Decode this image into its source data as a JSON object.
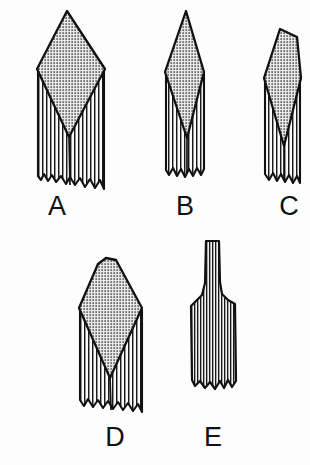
{
  "plate": {
    "background_color": "#fdfdfd",
    "ink_color": "#111111",
    "stipple_fill_color": "#d9d9d9",
    "hatch_fill_color": "#8a8a8a",
    "width": 310,
    "height": 465,
    "caption": "",
    "figure_count": 5
  },
  "figures": [
    {
      "id": "A",
      "label": "A",
      "description": "Broad bipointed diamond-shaped blade with stippled face and long vertically hatched hafted stem with ragged basal edge",
      "blade_texture": "stipple",
      "stem_texture": "vertical-hatch",
      "row": 1,
      "column": 1
    },
    {
      "id": "B",
      "label": "B",
      "description": "Narrow elongated bipointed blade with stippled face and vertically hatched stem, ragged base",
      "blade_texture": "stipple",
      "stem_texture": "vertical-hatch",
      "row": 1,
      "column": 2
    },
    {
      "id": "C",
      "label": "C",
      "description": "Narrow asymmetric blade with obliquely truncated tip, stippled face and vertically hatched stem",
      "blade_texture": "stipple",
      "stem_texture": "vertical-hatch",
      "row": 1,
      "column": 3
    },
    {
      "id": "D",
      "label": "D",
      "description": "Broad rounded-shoulder diamond blade with stippled face over vertically hatched stem, ragged base",
      "blade_texture": "stipple",
      "stem_texture": "vertical-hatch",
      "row": 2,
      "column": 1
    },
    {
      "id": "E",
      "label": "E",
      "description": "Flared spatulate form with narrow parallel-sided stem expanding to broad rectangular blade, fully vertically hatched, ragged base",
      "blade_texture": "vertical-hatch",
      "stem_texture": "vertical-hatch",
      "row": 2,
      "column": 2
    }
  ],
  "labels": {
    "a": "A",
    "b": "B",
    "c": "C",
    "d": "D",
    "e": "E"
  }
}
